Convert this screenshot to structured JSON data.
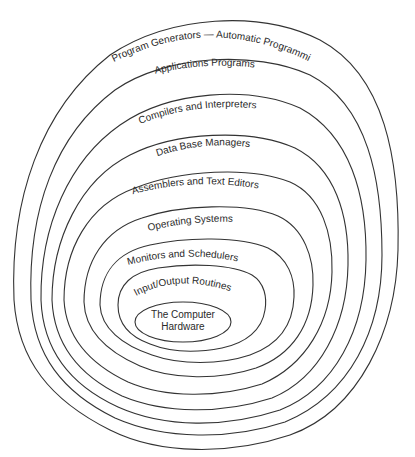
{
  "diagram": {
    "stroke_color": "#333333",
    "text_color": "#2a2a2a",
    "layers": [
      {
        "label": "Program Generators — Automatic Programming"
      },
      {
        "label": "Applications Programs"
      },
      {
        "label": "Compilers and Interpreters"
      },
      {
        "label": "Data Base Managers"
      },
      {
        "label": "Assemblers and Text Editors"
      },
      {
        "label": "Operating Systems"
      },
      {
        "label": "Monitors and Schedulers"
      },
      {
        "label": "Input/Output Routines"
      }
    ],
    "core": {
      "line1": "The Computer",
      "line2": "Hardware"
    }
  }
}
